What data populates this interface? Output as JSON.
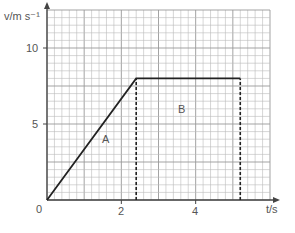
{
  "chart_data": {
    "type": "line",
    "title": "",
    "xlabel": "t/s",
    "ylabel": "v/m s⁻¹",
    "xlim": [
      0,
      6
    ],
    "ylim": [
      0,
      12.5
    ],
    "x_ticks": [
      {
        "value": 0,
        "label": "0"
      },
      {
        "value": 2,
        "label": "2"
      },
      {
        "value": 4,
        "label": "4"
      }
    ],
    "y_ticks": [
      {
        "value": 5,
        "label": "5"
      },
      {
        "value": 10,
        "label": "10"
      }
    ],
    "grid": true,
    "series": [
      {
        "name": "velocity",
        "x": [
          0,
          2.4,
          5.2
        ],
        "y": [
          0,
          8,
          8
        ]
      }
    ],
    "dashed_lines": [
      {
        "x": 2.4,
        "y_from": 0,
        "y_to": 8
      },
      {
        "x": 5.2,
        "y_from": 0,
        "y_to": 8
      }
    ],
    "annotations": [
      {
        "text": "A",
        "x": 1.6,
        "y": 4
      },
      {
        "text": "B",
        "x": 3.7,
        "y": 6
      }
    ]
  },
  "labels": {
    "y_axis": "v/m s⁻¹",
    "x_axis": "t/s",
    "origin": "0",
    "x2": "2",
    "x4": "4",
    "y5": "5",
    "y10": "10",
    "region_a": "A",
    "region_b": "B"
  }
}
